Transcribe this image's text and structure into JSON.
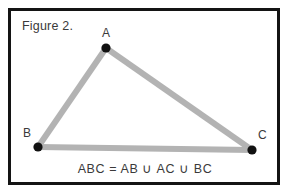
{
  "figure": {
    "caption": "Figure 2.",
    "equation": "ABC = AB ∪ AC ∪ BC",
    "colors": {
      "frame": "#141414",
      "background": "#ffffff",
      "edge_stroke": "#b3b3b3",
      "vertex_dot": "#111111",
      "text": "#3a3a3a"
    },
    "vertices": [
      {
        "label": "A",
        "x": 106,
        "y": 48
      },
      {
        "label": "B",
        "x": 38,
        "y": 147
      },
      {
        "label": "C",
        "x": 252,
        "y": 150
      }
    ],
    "edges": [
      {
        "name": "AB",
        "from": "B",
        "to": "A"
      },
      {
        "name": "AC",
        "from": "A",
        "to": "C"
      },
      {
        "name": "BC",
        "from": "B",
        "to": "C"
      }
    ],
    "edge_width": 6,
    "dot_radius": 4.6
  }
}
